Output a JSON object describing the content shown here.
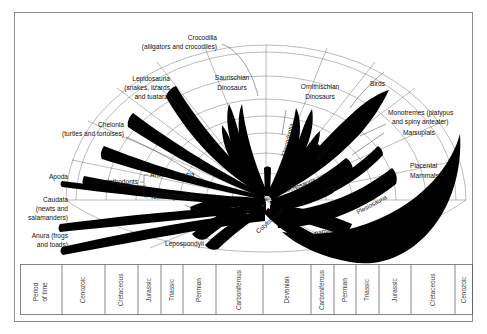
{
  "figure": {
    "background_color": "#ffffff",
    "ink_color": "#000000",
    "frame_color": "#8c8c8c"
  },
  "timeline": {
    "axis_label": "Period of time",
    "axis_label_line1": "Period",
    "axis_label_line2": "of time",
    "periods": [
      "Cenozoic",
      "Cretaceous",
      "Jurassic",
      "Triassic",
      "Permian",
      "Carboniferous",
      "Devonian",
      "Carboniferous",
      "Permian",
      "Triassic",
      "Jurassic",
      "Cretaceous",
      "Cenozoic"
    ]
  },
  "taxa": {
    "left": [
      {
        "id": "crocodilia",
        "name": "Crocodilia",
        "subtitle": "(alligators and crocodiles)"
      },
      {
        "id": "lepidosauria",
        "name": "Lepidosauria",
        "subtitle": "(snakes, lizards and tuatara)"
      },
      {
        "id": "chelonia",
        "name": "Chelonia",
        "subtitle": "(turtles and tortoises)"
      },
      {
        "id": "apoda",
        "name": "Apoda",
        "subtitle": ""
      },
      {
        "id": "caudata",
        "name": "Caudata",
        "subtitle": "(newts and salamanders)"
      },
      {
        "id": "anura",
        "name": "Anura  (frogs and toads)",
        "subtitle": ""
      }
    ],
    "center": [
      {
        "id": "saurischian-dinosaurs",
        "name": "Saurischian Dinosaurs"
      },
      {
        "id": "ornithischian-dinosaurs",
        "name": "Ornithischian Dinosaurs"
      },
      {
        "id": "thecodontia",
        "name": "Thecodontia"
      },
      {
        "id": "pterosaurs",
        "name": "Pterosaurs"
      },
      {
        "id": "archosauria",
        "name": "Archosauria"
      },
      {
        "id": "ichthyosauria",
        "name": "Ichthyosauria"
      },
      {
        "id": "plesiosauria",
        "name": "Plesiosauria"
      },
      {
        "id": "cotylosauria",
        "name": "Cotylosauria"
      },
      {
        "id": "synapsida",
        "name": "Synapsida"
      },
      {
        "id": "labyrinthodonts",
        "name": "Labyrinthodonts"
      },
      {
        "id": "anthracosauria",
        "name": "Anthracosauria"
      },
      {
        "id": "temnospondyli",
        "name": "Temnospondyli"
      },
      {
        "id": "lepospondyli",
        "name": "Lepospondyli"
      }
    ],
    "right": [
      {
        "id": "birds",
        "name": "Birds",
        "subtitle": ""
      },
      {
        "id": "monotremes",
        "name": "Monotremes (platypus",
        "subtitle": "and spiny anteater)"
      },
      {
        "id": "marsupials",
        "name": "Marsupials",
        "subtitle": ""
      },
      {
        "id": "placental-mammals",
        "name": "Placental",
        "subtitle": "Mammals"
      }
    ]
  },
  "labels": {
    "crocodilia_l1": "Crocodilia",
    "crocodilia_l2": "(alligators and crocodiles)",
    "lepidosauria_l1": "Lepidosauria",
    "lepidosauria_l2": "(snakes, lizards",
    "lepidosauria_l3": "and tuatara)",
    "chelonia_l1": "Chelonia",
    "chelonia_l2": "(turtles and tortoises)",
    "apoda": "Apoda",
    "caudata_l1": "Caudata",
    "caudata_l2": "(newts and",
    "caudata_l3": "salamanders)",
    "anura_l1": "Anura  (frogs",
    "anura_l2": "and toads)",
    "labyrinthodonts": "Labyrinthodonts",
    "anthracosauria": "Anthracosauria",
    "temnospondyli": "Temnospondyli",
    "lepospondyli": "Lepospondyli",
    "saurischian_l1": "Saurischian",
    "saurischian_l2": "Dinosaurs",
    "ornithischian_l1": "Ornithischian",
    "ornithischian_l2": "Dinosaurs",
    "thecodontia": "Thecodontia",
    "pterosaurs": "Pterosaurs",
    "archosauria": "Archosauria",
    "ichthyosauria": "Ichthyosauria",
    "plesiosauria": "Plesiosauria",
    "cotylosauria": "Cotylosauria",
    "synapsida": "Synapsida",
    "birds": "Birds",
    "monotremes_l1": "Monotremes (platypus",
    "monotremes_l2": "and spiny anteater)",
    "marsupials": "Marsupials",
    "placental_l1": "Placental",
    "placental_l2": "Mammals"
  }
}
